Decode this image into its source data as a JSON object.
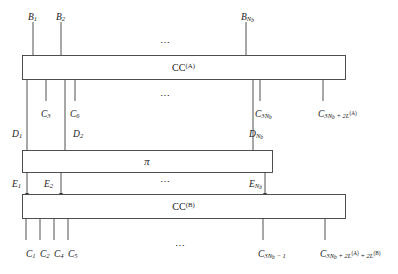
{
  "figure": {
    "stroke_color": "#3c3c3c",
    "background": "#ffffff"
  },
  "boxes": [
    {
      "id": "cc-a",
      "label_plain": "CC",
      "label_sup": "(A)",
      "x": 22,
      "y": 55,
      "w": 323,
      "h": 24
    },
    {
      "id": "pi",
      "label_plain": "π",
      "label_sup": "",
      "x": 22,
      "y": 150,
      "w": 250,
      "h": 22
    },
    {
      "id": "cc-b",
      "label_plain": "CC",
      "label_sup": "(B)",
      "x": 22,
      "y": 194,
      "w": 323,
      "h": 24
    }
  ],
  "inputs_top": {
    "labels": [
      {
        "base": "B",
        "sub": "1",
        "x": 28,
        "y": 13
      },
      {
        "base": "B",
        "sub": "2",
        "x": 56,
        "y": 13
      },
      {
        "base": "B",
        "sub": "N",
        "sub2": "b",
        "x": 241,
        "y": 13
      }
    ],
    "ellipsis": {
      "text": "⋯",
      "x": 165,
      "y": 42
    }
  },
  "mid_upper": {
    "c_labels": [
      {
        "base": "C",
        "sub": "3",
        "x": 41,
        "y": 110
      },
      {
        "base": "C",
        "sub": "6",
        "x": 70,
        "y": 110
      },
      {
        "base": "C",
        "sub": "3N",
        "sub2": "b",
        "x": 255,
        "y": 110
      },
      {
        "base": "C",
        "sub": "3N",
        "sub2": "b",
        "suffix": " + 2L",
        "sup": "(A)",
        "x": 318,
        "y": 110
      }
    ],
    "d_labels": [
      {
        "base": "D",
        "sub": "1",
        "x": 12,
        "y": 130
      },
      {
        "base": "D",
        "sub": "2",
        "x": 73,
        "y": 130
      },
      {
        "base": "D",
        "sub": "N",
        "sub2": "b",
        "x": 249,
        "y": 130
      }
    ],
    "ellipsis": {
      "text": "⋯",
      "x": 165,
      "y": 95
    }
  },
  "mid_lower": {
    "e_labels": [
      {
        "base": "E",
        "sub": "1",
        "x": 12,
        "y": 180
      },
      {
        "base": "E",
        "sub": "2",
        "x": 44,
        "y": 180
      },
      {
        "base": "E",
        "sub": "N",
        "sub2": "b",
        "x": 249,
        "y": 180
      }
    ],
    "ellipsis": {
      "text": "⋯",
      "x": 165,
      "y": 181
    }
  },
  "outputs_bottom": {
    "labels": [
      {
        "base": "C",
        "sub": "1",
        "x": 26,
        "y": 250
      },
      {
        "base": "C",
        "sub": "2",
        "x": 40,
        "y": 250
      },
      {
        "base": "C",
        "sub": "4",
        "x": 54,
        "y": 250
      },
      {
        "base": "C",
        "sub": "5",
        "x": 68,
        "y": 250
      },
      {
        "base": "C",
        "sub": "3N",
        "sub2": "b",
        "suffix": " − 1",
        "x": 258,
        "y": 250
      },
      {
        "base": "C",
        "sub": "3N",
        "sub2": "b",
        "suffix": " + 2L",
        "sup": "(A)",
        "suffix2": " + 2L",
        "sup2": "(B)",
        "x": 320,
        "y": 250
      }
    ],
    "ellipsis": {
      "text": "⋯",
      "x": 180,
      "y": 245
    }
  },
  "wires": {
    "top_inputs": [
      {
        "x": 33,
        "y1": 22,
        "y2": 55
      },
      {
        "x": 61,
        "y1": 22,
        "y2": 55
      },
      {
        "x": 246,
        "y1": 22,
        "y2": 55
      }
    ],
    "cc_a_to_c": [
      {
        "x": 46,
        "y1": 79,
        "y2": 101
      },
      {
        "x": 75,
        "y1": 79,
        "y2": 101
      },
      {
        "x": 260,
        "y1": 79,
        "y2": 101
      },
      {
        "x": 323,
        "y1": 79,
        "y2": 101
      }
    ],
    "cc_a_to_pi": [
      {
        "x": 27,
        "y1": 79,
        "y2": 150
      },
      {
        "x": 65,
        "y1": 79,
        "y2": 150
      },
      {
        "x": 253,
        "y1": 79,
        "y2": 150
      }
    ],
    "pi_to_cc_b": [
      {
        "x": 27,
        "y1": 172,
        "y2": 194
      },
      {
        "x": 61,
        "y1": 172,
        "y2": 194
      },
      {
        "x": 265,
        "y1": 172,
        "y2": 194
      }
    ],
    "cc_b_outputs": [
      {
        "x": 26,
        "y1": 218,
        "y2": 240
      },
      {
        "x": 40,
        "y1": 218,
        "y2": 240
      },
      {
        "x": 54,
        "y1": 218,
        "y2": 240
      },
      {
        "x": 68,
        "y1": 218,
        "y2": 240
      },
      {
        "x": 263,
        "y1": 218,
        "y2": 240
      },
      {
        "x": 325,
        "y1": 218,
        "y2": 240
      }
    ]
  }
}
